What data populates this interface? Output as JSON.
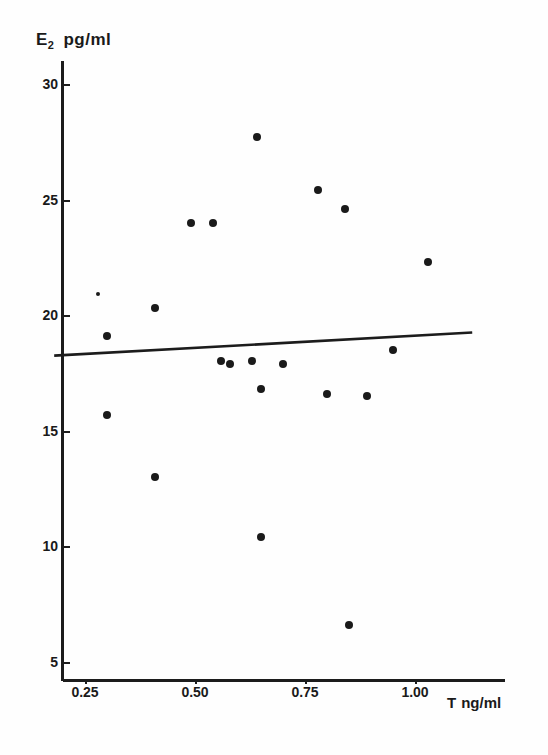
{
  "chart_data": {
    "type": "scatter",
    "title": "",
    "ylabel": "E2 pg/ml",
    "ylabel_base": "E",
    "ylabel_sub": "2",
    "ylabel_unit": "pg/ml",
    "xlabel": "T ng/ml",
    "xlabel_base": "T",
    "xlabel_unit": "ng/ml",
    "xlim": [
      0.18,
      1.11
    ],
    "ylim": [
      3.9,
      30.9
    ],
    "xticks": [
      0.25,
      0.5,
      0.75,
      1.0
    ],
    "xtick_labels": [
      "0.25",
      "0.50",
      "0.75",
      "1.00"
    ],
    "yticks": [
      5,
      10,
      15,
      20,
      25,
      30
    ],
    "ytick_labels": [
      "5",
      "10",
      "15",
      "20",
      "25",
      "30"
    ],
    "grid": false,
    "legend": false,
    "marker_color": "#1a1a1a",
    "axis_color": "#1c1c1c",
    "points": [
      {
        "x": 0.28,
        "y": 20.9,
        "size": "small"
      },
      {
        "x": 0.3,
        "y": 19.1,
        "size": "normal"
      },
      {
        "x": 0.3,
        "y": 15.7,
        "size": "normal"
      },
      {
        "x": 0.41,
        "y": 20.3,
        "size": "normal"
      },
      {
        "x": 0.41,
        "y": 13.0,
        "size": "normal"
      },
      {
        "x": 0.49,
        "y": 24.0,
        "size": "normal"
      },
      {
        "x": 0.54,
        "y": 24.0,
        "size": "normal"
      },
      {
        "x": 0.56,
        "y": 18.0,
        "size": "normal"
      },
      {
        "x": 0.58,
        "y": 17.9,
        "size": "normal"
      },
      {
        "x": 0.63,
        "y": 18.0,
        "size": "normal"
      },
      {
        "x": 0.64,
        "y": 27.7,
        "size": "normal"
      },
      {
        "x": 0.65,
        "y": 16.8,
        "size": "normal"
      },
      {
        "x": 0.65,
        "y": 10.4,
        "size": "normal"
      },
      {
        "x": 0.7,
        "y": 17.9,
        "size": "normal"
      },
      {
        "x": 0.78,
        "y": 25.4,
        "size": "normal"
      },
      {
        "x": 0.8,
        "y": 16.6,
        "size": "normal"
      },
      {
        "x": 0.84,
        "y": 24.6,
        "size": "normal"
      },
      {
        "x": 0.85,
        "y": 6.6,
        "size": "normal"
      },
      {
        "x": 0.89,
        "y": 16.5,
        "size": "normal"
      },
      {
        "x": 0.95,
        "y": 18.5,
        "size": "normal"
      },
      {
        "x": 1.03,
        "y": 22.3,
        "size": "normal"
      }
    ],
    "fit_line": {
      "x_start": 0.18,
      "y_start": 18.25,
      "x_end": 1.13,
      "y_end": 19.25
    }
  }
}
